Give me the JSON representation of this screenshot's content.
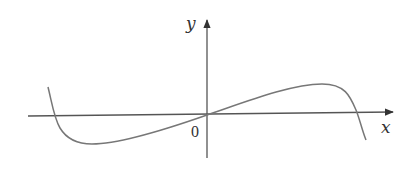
{
  "diagram": {
    "x_axis_label": "x",
    "y_axis_label": "y",
    "origin_label": "0",
    "colors": {
      "axis": "#333333",
      "curve": "#777777",
      "background": "#ffffff"
    },
    "curve_description": "Odd cubic-like curve through the origin: descends steeply from upper left, crosses x-axis, reaches local minimum left of origin, rises through origin, reaches local maximum right of origin, then falls steeply crossing x-axis"
  }
}
